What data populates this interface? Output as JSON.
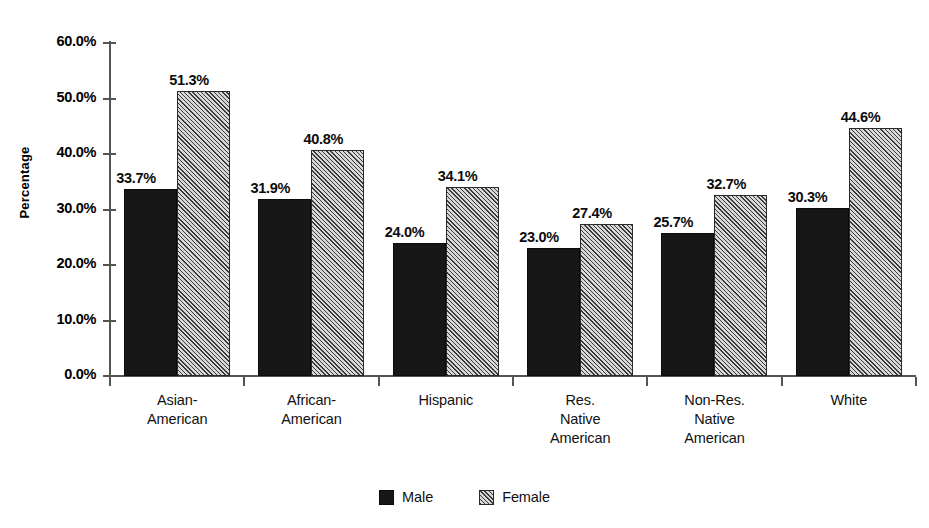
{
  "chart_data": {
    "type": "bar",
    "title": "",
    "xlabel": "",
    "ylabel": "Percentage",
    "ylim": [
      0,
      60
    ],
    "ytick_labels": [
      "0.0%",
      "10.0%",
      "20.0%",
      "30.0%",
      "40.0%",
      "50.0%",
      "60.0%"
    ],
    "ytick_values": [
      0,
      10,
      20,
      30,
      40,
      50,
      60
    ],
    "grid": false,
    "legend_position": "bottom-center",
    "categories": [
      "Asian-\nAmerican",
      "African-\nAmerican",
      "Hispanic",
      "Res.\nNative\nAmerican",
      "Non-Res.\nNative\nAmerican",
      "White"
    ],
    "series": [
      {
        "name": "Male",
        "style": "solid-black",
        "color": "#171717",
        "values": [
          33.7,
          31.9,
          24.0,
          23.0,
          25.7,
          30.3
        ],
        "labels": [
          "33.7%",
          "31.9%",
          "24.0%",
          "23.0%",
          "25.7%",
          "30.3%"
        ]
      },
      {
        "name": "Female",
        "style": "diagonal-hatch-gray",
        "color": "#bdbdbd",
        "values": [
          51.3,
          40.8,
          34.1,
          27.4,
          32.7,
          44.6
        ],
        "labels": [
          "51.3%",
          "40.8%",
          "34.1%",
          "27.4%",
          "32.7%",
          "44.6%"
        ]
      }
    ]
  },
  "legend": {
    "items": [
      {
        "label": "Male"
      },
      {
        "label": "Female"
      }
    ]
  },
  "colors": {
    "male_bar": "#171717",
    "female_bar": "#bdbdbd",
    "hatch": "#3a3a3a",
    "axis": "#555555",
    "text": "#111111",
    "background": "#ffffff"
  }
}
